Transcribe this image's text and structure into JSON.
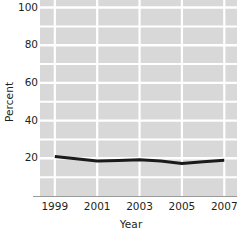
{
  "chart_data": {
    "type": "line",
    "title": "",
    "xlabel": "Year",
    "ylabel": "Percent",
    "x": [
      1999,
      2000,
      2001,
      2002,
      2003,
      2004,
      2005,
      2006,
      2007
    ],
    "series": [
      {
        "name": "Percent",
        "values": [
          21,
          19.8,
          18.6,
          18.8,
          19.2,
          18.6,
          17.2,
          18.2,
          19.0
        ]
      }
    ],
    "xlim": [
      1998.3,
      2007.6
    ],
    "ylim": [
      0,
      104
    ],
    "xticks": [
      1999,
      2001,
      2003,
      2005,
      2007
    ],
    "xtick_labels": [
      "1999",
      "2001",
      "2003",
      "2005",
      "2007"
    ],
    "yticks": [
      20,
      40,
      60,
      80,
      100
    ],
    "ytick_labels": [
      "20",
      "40",
      "60",
      "80",
      "100"
    ],
    "grid": true,
    "grid_color": "#ffffff",
    "plot_background": "#d8d8d8",
    "line_color": "#1a1a1a",
    "line_width": 3,
    "legend": null,
    "legend_position": "none"
  },
  "axes": {
    "y_title": "Percent",
    "x_title": "Year"
  }
}
